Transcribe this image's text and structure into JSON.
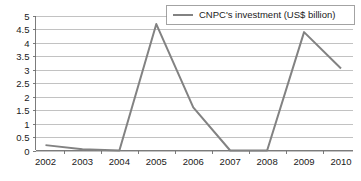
{
  "chart_data": {
    "type": "line",
    "title": "",
    "subtitle": "",
    "xlabel": "",
    "ylabel": "",
    "categories": [
      "2002",
      "2003",
      "2004",
      "2005",
      "2006",
      "2007",
      "2008",
      "2009",
      "2010"
    ],
    "values": [
      0.2,
      0.05,
      0.0,
      4.7,
      1.6,
      0.0,
      0.0,
      4.4,
      3.05
    ],
    "series": [
      {
        "name": "CNPC's investment (US$ billion)",
        "values": [
          0.2,
          0.05,
          0.0,
          4.7,
          1.6,
          0.0,
          0.0,
          4.4,
          3.05
        ],
        "color": "#828282"
      }
    ],
    "ylim": [
      0,
      5
    ],
    "y_ticks": [
      "0",
      "0.5",
      "1",
      "1.5",
      "2",
      "2.5",
      "3",
      "3.5",
      "4",
      "4.5",
      "5"
    ],
    "y_tick_values": [
      0,
      0.5,
      1,
      1.5,
      2,
      2.5,
      3,
      3.5,
      4,
      4.5,
      5
    ],
    "x_ticks": [
      "2002",
      "2003",
      "2004",
      "2005",
      "2006",
      "2007",
      "2008",
      "2009",
      "2010"
    ],
    "grid": "horizontal",
    "legend_position": "top-right",
    "legend": [
      {
        "label": "CNPC's investment (US$ billion)",
        "color": "#828282",
        "marker": "line-swatch"
      }
    ],
    "annotations": []
  },
  "axes": {
    "y_axis_name": "value-axis",
    "x_axis_name": "year-axis"
  },
  "colors": {
    "series": "#828282",
    "gridline": "#a8a8a8",
    "axis": "#6e6e6e",
    "text": "#1a1a1a",
    "background": "#ffffff"
  }
}
